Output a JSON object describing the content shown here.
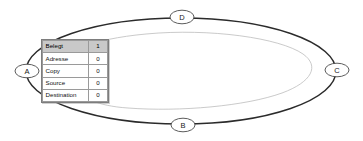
{
  "diagram": {
    "background_color": "#ffffff",
    "outer_ring": {
      "name": "outer-cycle-ellipse",
      "stroke_color": "#2b2b2b",
      "cx": 181,
      "cy": 71,
      "rx": 157,
      "ry": 53
    },
    "inner_ring": {
      "name": "inner-flow-arrow",
      "stroke_color": "#bdbdbd",
      "direction": "counter-clockwise",
      "arrow_target": "A"
    },
    "nodes": [
      {
        "id": "A",
        "label": "A",
        "x": 27,
        "y": 71,
        "position": "left"
      },
      {
        "id": "B",
        "label": "B",
        "x": 183,
        "y": 125,
        "position": "bottom"
      },
      {
        "id": "C",
        "label": "C",
        "x": 337,
        "y": 70,
        "position": "right"
      },
      {
        "id": "D",
        "label": "D",
        "x": 182,
        "y": 17,
        "position": "top"
      }
    ]
  },
  "property_table": {
    "name": "property-table",
    "header_background": "#c9c9c9",
    "rows": [
      {
        "name": "Belegt",
        "value": "1",
        "header": true
      },
      {
        "name": "Adresse",
        "value": "0",
        "header": false
      },
      {
        "name": "Copy",
        "value": "0",
        "header": false
      },
      {
        "name": "Source",
        "value": "0",
        "header": false
      },
      {
        "name": "Destination",
        "value": "0",
        "header": false
      }
    ]
  }
}
